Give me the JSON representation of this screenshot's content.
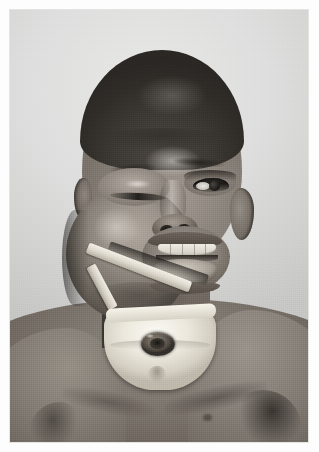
{
  "page": {
    "type": "clinical-photograph",
    "background_color": "#ffffff",
    "margin_px": 10
  },
  "photograph": {
    "caption": "",
    "orientation": "portrait",
    "tone": "black-and-white",
    "backdrop_color": "#d8d8d6",
    "subject": "young child, frontal view, head and upper chest",
    "regions": [
      {
        "name": "backdrop",
        "label": "plain light studio backdrop"
      },
      {
        "name": "head",
        "label": "head with short cropped hair"
      },
      {
        "name": "facial-mass",
        "label": "large swelling of the left cheek and jaw"
      },
      {
        "name": "left-eye",
        "label": "left eye swollen nearly closed"
      },
      {
        "name": "right-eye",
        "label": "right eye open"
      },
      {
        "name": "mouth",
        "label": "mouth held open, upper teeth and protruding tissue visible"
      },
      {
        "name": "jaw-strap",
        "label": "pale cloth tie passing under the jaw"
      },
      {
        "name": "neck-dressing",
        "label": "white gauze dressing over the front of the neck"
      },
      {
        "name": "tracheostomy",
        "label": "tracheostomy stoma at the centre of the dressing"
      },
      {
        "name": "chest",
        "label": "bare chest and shoulders"
      }
    ]
  },
  "colors": {
    "paper": "#ffffff",
    "backdrop": "#d8d8d6",
    "skin_mid": "#8d867e",
    "skin_shadow": "#5c564f",
    "hair": "#332f2b",
    "dressing": "#ece8dd",
    "stoma": "#4a443d"
  }
}
